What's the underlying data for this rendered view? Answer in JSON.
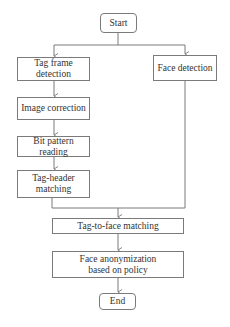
{
  "diagram": {
    "type": "flowchart",
    "nodes": {
      "start": "Start",
      "tag_frame_detection": "Tag frame detection",
      "face_detection": "Face detection",
      "image_correction": "Image correction",
      "bit_pattern_reading": "Bit pattern reading",
      "tag_header_matching": "Tag-header matching",
      "tag_to_face_matching": "Tag-to-face matching",
      "face_anonymization": "Face anonymization based on policy",
      "end": "End"
    },
    "edges": [
      [
        "Start",
        "Tag frame detection"
      ],
      [
        "Start",
        "Face detection"
      ],
      [
        "Tag frame detection",
        "Image correction"
      ],
      [
        "Image correction",
        "Bit pattern reading"
      ],
      [
        "Bit pattern reading",
        "Tag-header matching"
      ],
      [
        "Tag-header matching",
        "Tag-to-face matching"
      ],
      [
        "Face detection",
        "Tag-to-face matching"
      ],
      [
        "Tag-to-face matching",
        "Face anonymization based on policy"
      ],
      [
        "Face anonymization based on policy",
        "End"
      ]
    ]
  },
  "colors": {
    "stroke": "#7a7a7a",
    "text": "#333333",
    "background": "#ffffff"
  }
}
